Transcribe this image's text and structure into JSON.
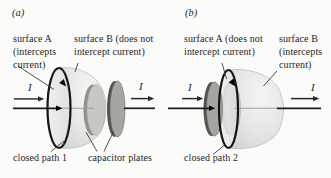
{
  "panel_a": {
    "tag": "(a)",
    "surface_a": "surface A\n(intercepts\ncurrent)",
    "surface_b": "surface B (does not\nintercept current)",
    "i_left": "I",
    "i_right": "I",
    "closed_path": "closed path 1",
    "capacitor": "capacitor plates"
  },
  "panel_b": {
    "tag": "(b)",
    "surface_a": "surface A (does not\nintercept current)",
    "surface_b": "surface B\n(intercepts\ncurrent)",
    "i_left": "I",
    "i_right": "I",
    "closed_path": "closed path 2"
  },
  "colors": {
    "background": "#fbfbfa",
    "bag_surface": "#e3e3e1",
    "bag_highlight": "#f5f5f3",
    "plate_face_dark": "#a4a6a2",
    "plate_rim_dark": "#525450",
    "plate_face_light": "#c6c8c4",
    "plate_rim_light": "#8f918d",
    "closed_path_stroke": "#151515",
    "wire": "#1c1c1c",
    "faint_wire": "#a0a0a0",
    "text": "#1f1f1f"
  }
}
